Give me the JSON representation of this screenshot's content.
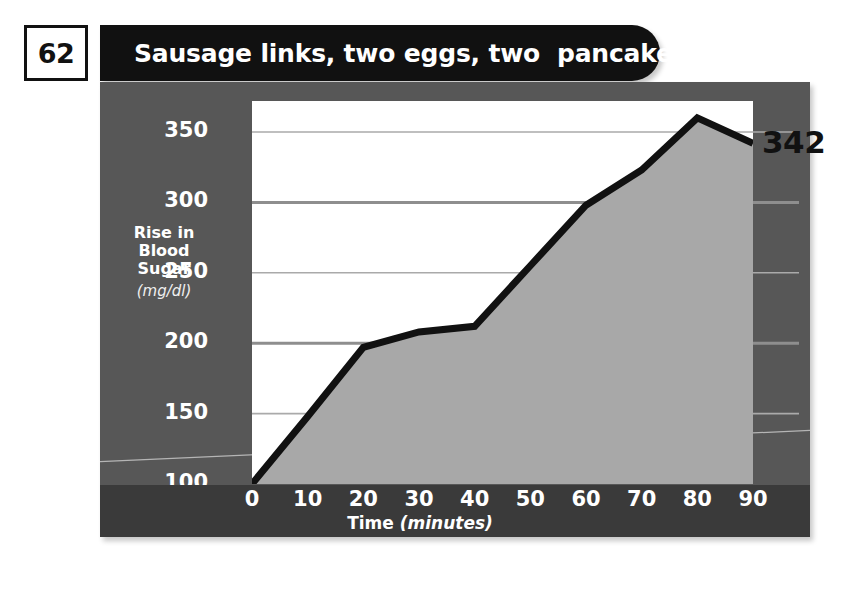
{
  "header": {
    "number": "62",
    "title": "Sausage links, two eggs, two  pancakes"
  },
  "annotation": {
    "end_value": "342"
  },
  "colors": {
    "panel": "#575757",
    "axis_band": "#3a3a3a",
    "plot_background": "#ffffff",
    "area_fill": "#a8a8a8",
    "line": "#111111",
    "gridline": "#aaaaaa",
    "gridline_strong": "#8e8e8e",
    "title_bar": "#111111",
    "tick_text": "#ffffff"
  },
  "chart_data": {
    "type": "area",
    "title": "Sausage links, two eggs, two  pancakes",
    "xlabel": "Time",
    "xunits": "(minutes)",
    "ylabel": "Rise in Blood Sugar",
    "yunits": "(mg/dl)",
    "x": [
      0,
      10,
      20,
      30,
      40,
      50,
      60,
      70,
      80,
      90
    ],
    "values": [
      100,
      148,
      197,
      208,
      212,
      255,
      298,
      323,
      360,
      342
    ],
    "xlim": [
      0,
      90
    ],
    "ylim": [
      100,
      372
    ],
    "xticks": [
      "0",
      "10",
      "20",
      "30",
      "40",
      "50",
      "60",
      "70",
      "80",
      "90"
    ],
    "yticks": [
      "100",
      "150",
      "200",
      "250",
      "300",
      "350"
    ],
    "ytick_values": [
      100,
      150,
      200,
      250,
      300,
      350
    ],
    "gridlines": true,
    "legend": "none",
    "annotations": [
      {
        "label": "342",
        "x": 90,
        "y": 342
      }
    ]
  }
}
